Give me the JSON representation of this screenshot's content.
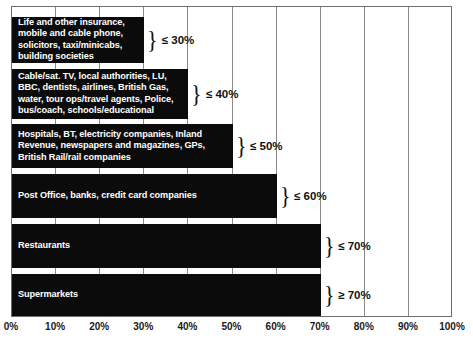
{
  "chart_data": {
    "type": "bar",
    "title": "",
    "subtitle": "",
    "xlabel": "",
    "ylabel": "",
    "orientation": "horizontal",
    "xlim": [
      0,
      100
    ],
    "grid": true,
    "legend_position": "none",
    "tick_labels": [
      "0%",
      "10%",
      "20%",
      "30%",
      "40%",
      "50%",
      "60%",
      "70%",
      "80%",
      "90%",
      "100%"
    ],
    "tick_values": [
      0,
      10,
      20,
      30,
      40,
      50,
      60,
      70,
      80,
      90,
      100
    ],
    "bar_color": "#0b0b0b",
    "bar_text_color": "#ffffff",
    "categories": [
      "Life and other insurance, mobile and cable phone, solicitors, taxi/minicabs, building societies",
      "Cable/sat. TV, local authorities, LU, BBC, dentists, airlines, British Gas, water, tour ops/travel agents, Police, bus/coach, schools/educational",
      "Hospitals, BT, electricity companies, Inland Revenue, newspapers and magazines, GPs, British Rail/rail companies",
      "Post Office, banks, credit card companies",
      "Restaurants",
      "Supermarkets"
    ],
    "values": [
      30,
      40,
      50,
      60,
      70,
      70
    ],
    "annotations": [
      "≤ 30%",
      "≤ 40%",
      "≤ 50%",
      "≤ 60%",
      "≤ 70%",
      "≥ 70%"
    ]
  },
  "bars": [
    {
      "label": "Life and other insurance,\nmobile and cable phone,\nsolicitors, taxi/minicabs,\nbuilding societies",
      "value": 30,
      "annotation": "≤ 30%",
      "top": 17,
      "height": 46
    },
    {
      "label": "Cable/sat. TV, local authorities, LU,\nBBC, dentists, airlines, British Gas,\nwater, tour ops/travel agents, Police,\nbus/coach, schools/educational",
      "value": 40,
      "annotation": "≤ 40%",
      "top": 69,
      "height": 50
    },
    {
      "label": "Hospitals, BT, electricity companies, Inland\nRevenue, newspapers and magazines, GPs,\nBritish Rail/rail companies",
      "value": 50,
      "annotation": "≤ 50%",
      "top": 124,
      "height": 44
    },
    {
      "label": "Post Office, banks, credit card companies",
      "value": 60,
      "annotation": "≤ 60%",
      "top": 174,
      "height": 44
    },
    {
      "label": "Restaurants",
      "value": 70,
      "annotation": "≤ 70%",
      "top": 224,
      "height": 44
    },
    {
      "label": "Supermarkets",
      "value": 70,
      "annotation": "≥ 70%",
      "top": 274,
      "height": 42
    }
  ],
  "brace_glyph": "}"
}
